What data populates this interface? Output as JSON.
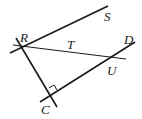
{
  "diagram": {
    "points": {
      "R": {
        "label": "R",
        "x": 22,
        "y": 47
      },
      "S": {
        "label": "S",
        "x": 108,
        "y": 6
      },
      "T": {
        "label": "T",
        "x": 70,
        "y": 44
      },
      "D": {
        "label": "D",
        "x": 135,
        "y": 42
      },
      "U": {
        "label": "U",
        "x": 113,
        "y": 58
      },
      "C": {
        "label": "C",
        "x": 52,
        "y": 97
      }
    },
    "segments": [
      {
        "name": "line-RS",
        "from": "R",
        "to": "S"
      },
      {
        "name": "line-RC",
        "from": "R",
        "to": "C"
      },
      {
        "name": "line-CD",
        "from": "C",
        "to": "D"
      },
      {
        "name": "line-RU",
        "from": "R",
        "to": "U"
      }
    ],
    "right_angle_at": "C"
  }
}
